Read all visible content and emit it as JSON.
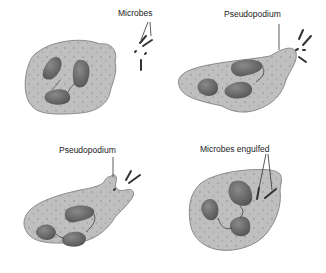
{
  "diagram": {
    "title": "",
    "panels": [
      {
        "id": "panel-1",
        "label": "Microbes"
      },
      {
        "id": "panel-2",
        "label": "Pseudopodium"
      },
      {
        "id": "panel-3",
        "label": "Pseudopodium"
      },
      {
        "id": "panel-4",
        "label": "Microbes engulfed"
      }
    ],
    "colors": {
      "cytoplasm": "#bdbdbd",
      "cytoplasm_edge": "#8a8a8a",
      "nucleus": "#6e6e6e",
      "nucleus_edge": "#4a4a4a",
      "microbe": "#333333",
      "granule": "#8f8f8f"
    }
  }
}
